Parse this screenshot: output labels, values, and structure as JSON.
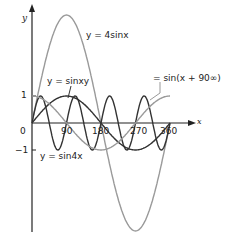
{
  "chart_data": {
    "type": "line",
    "title": "",
    "xlabel": "x",
    "ylabel": "y",
    "xlim": [
      0,
      360
    ],
    "ylim": [
      -4,
      4
    ],
    "x_ticks": [
      "0",
      "90",
      "180",
      "270",
      "360"
    ],
    "y_ticks": [
      "1",
      "-1"
    ],
    "grid": false,
    "series": [
      {
        "name": "y = 4sinx",
        "func": "4*sin(x)",
        "color": "#9a9a9a",
        "amplitude": 4,
        "frequency": 1,
        "phase": 0
      },
      {
        "name": "y = sinx",
        "func": "sin(x)",
        "color": "#333333",
        "amplitude": 1,
        "frequency": 1,
        "phase": 0
      },
      {
        "name": "y = sin4x",
        "func": "sin(4x)",
        "color": "#333333",
        "amplitude": 1,
        "frequency": 4,
        "phase": 0
      },
      {
        "name": "y = sin(x + 90°)",
        "func": "sin(x+90)",
        "color": "#9a9a9a",
        "amplitude": 1,
        "frequency": 1,
        "phase": 90
      }
    ],
    "annotations": [
      "y = 4sinx",
      "y = sinxy",
      "y = sin4x",
      "= sin(x + 90∞)"
    ]
  },
  "labels": {
    "y_axis": "y",
    "x_axis": "x",
    "origin": "0",
    "tick_90": "90",
    "tick_180": "180",
    "tick_270": "270",
    "tick_360": "360",
    "tick_1": "1",
    "tick_m1": "−1",
    "ann_4sinx": "y = 4sinx",
    "ann_sinx": "y = sinxy",
    "ann_sin4x": "y = sin4x",
    "ann_phase": "= sin(x + 90∞)"
  }
}
